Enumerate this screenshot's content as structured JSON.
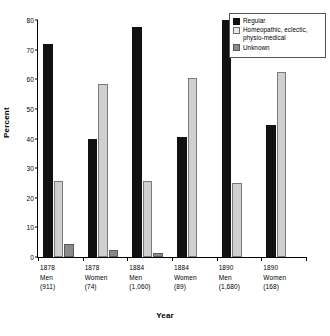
{
  "chart_data": {
    "type": "bar",
    "title": "",
    "xlabel": "Year",
    "ylabel": "Percent",
    "ylim": [
      0,
      80
    ],
    "yticks": [
      0,
      10,
      20,
      30,
      40,
      50,
      60,
      70,
      80
    ],
    "grid": false,
    "legend_position": "top-right",
    "categories": [
      "1878 Men (911)",
      "1878 Women (74)",
      "1884 Men (1,060)",
      "1884 Women (89)",
      "1890 Men (1,680)",
      "1890 Women (168)"
    ],
    "category_lines": [
      [
        "1878",
        "Men",
        "(911)"
      ],
      [
        "1878",
        "Women",
        "(74)"
      ],
      [
        "1884",
        "Men",
        "(1,060)"
      ],
      [
        "1884",
        "Women",
        "(89)"
      ],
      [
        "1890",
        "Men",
        "(1,680)"
      ],
      [
        "1890",
        "Women",
        "(168)"
      ]
    ],
    "series": [
      {
        "name": "Regular",
        "color": "#111111",
        "values": [
          72,
          40,
          77.5,
          40.5,
          80,
          44.5
        ]
      },
      {
        "name": "Homeopathic, eclectic, physio-medical",
        "color": "#cfcfcf",
        "values": [
          25.5,
          58.5,
          25.5,
          60.5,
          25,
          62.5
        ]
      },
      {
        "name": "Unknown",
        "color": "#8a8a8a",
        "values": [
          4.5,
          2.5,
          1.5,
          0,
          0,
          0
        ]
      }
    ]
  },
  "legend": {
    "entries": [
      {
        "label": "Regular"
      },
      {
        "label": "Homeopathic, eclectic,",
        "label2": "physio-medical"
      },
      {
        "label": "Unknown"
      }
    ]
  },
  "axes": {
    "y_title": "Percent",
    "x_title": "Year"
  }
}
